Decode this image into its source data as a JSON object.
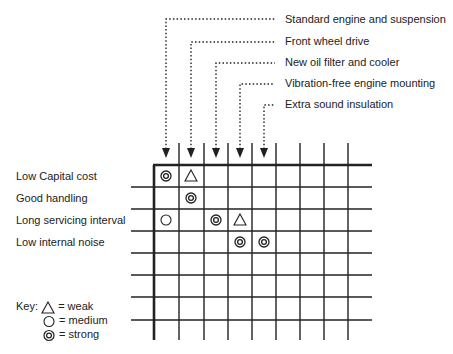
{
  "columns": [
    {
      "label": "Standard engine and suspension"
    },
    {
      "label": "Front wheel drive"
    },
    {
      "label": "New oil filter and cooler"
    },
    {
      "label": "Vibration-free engine mounting"
    },
    {
      "label": "Extra sound insulation"
    }
  ],
  "rows": [
    {
      "label": "Low Capital cost"
    },
    {
      "label": "Good handling"
    },
    {
      "label": "Long servicing interval"
    },
    {
      "label": "Low internal noise"
    }
  ],
  "matrix": [
    {
      "row": 0,
      "col": 0,
      "strength": "strong"
    },
    {
      "row": 0,
      "col": 1,
      "strength": "weak"
    },
    {
      "row": 1,
      "col": 1,
      "strength": "strong"
    },
    {
      "row": 2,
      "col": 0,
      "strength": "medium"
    },
    {
      "row": 2,
      "col": 2,
      "strength": "strong"
    },
    {
      "row": 2,
      "col": 3,
      "strength": "weak"
    },
    {
      "row": 3,
      "col": 3,
      "strength": "strong"
    },
    {
      "row": 3,
      "col": 4,
      "strength": "strong"
    }
  ],
  "grid": {
    "total_columns": 9,
    "total_rows": 8
  },
  "key": {
    "title": "Key:",
    "items": [
      {
        "symbol": "triangle",
        "text": "= weak"
      },
      {
        "symbol": "circle",
        "text": "= medium"
      },
      {
        "symbol": "double-circle",
        "text": "= strong"
      }
    ]
  },
  "colors": {
    "line": "#222222",
    "background": "#ffffff"
  }
}
